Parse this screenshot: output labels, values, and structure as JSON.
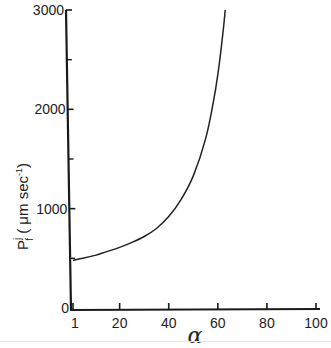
{
  "chart_data": {
    "type": "line",
    "title": "",
    "xlabel": "α",
    "ylabel": "P_f^j (μm sec⁻¹)",
    "ylabel_parts": {
      "main": "P",
      "sup": "j",
      "sub": "f",
      "units": "( μm sec",
      "units_exp": "-1",
      "close": ")"
    },
    "xlim": [
      1,
      100
    ],
    "ylim": [
      0,
      3000
    ],
    "x_ticks": [
      1,
      20,
      40,
      60,
      80,
      100
    ],
    "x_tick_labels": [
      "1",
      "20",
      "40",
      "60",
      "80",
      "100"
    ],
    "y_ticks": [
      0,
      1000,
      2000,
      3000
    ],
    "y_tick_labels": [
      "0",
      "1000",
      "2000",
      "3000"
    ],
    "y_minor_ticks": [
      500,
      1500,
      2500
    ],
    "grid": false,
    "legend": null,
    "series": [
      {
        "name": "P_f^j vs α",
        "color": "#222222",
        "x": [
          1,
          5,
          10,
          15,
          20,
          25,
          30,
          35,
          40,
          45,
          50,
          55,
          58,
          60,
          62,
          63
        ],
        "y": [
          480,
          500,
          530,
          570,
          610,
          660,
          720,
          800,
          920,
          1090,
          1330,
          1700,
          2050,
          2350,
          2750,
          3000
        ]
      }
    ]
  }
}
